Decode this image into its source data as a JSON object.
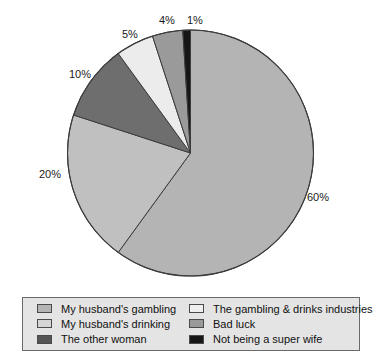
{
  "chart_data": {
    "type": "pie",
    "title": "",
    "subtitle": "",
    "xlabel": "",
    "ylabel": "",
    "grid": false,
    "legend_position": "bottom",
    "start_angle_deg": 0,
    "direction": "clockwise",
    "categories": [
      "My husband's gambling",
      "My husband's drinking",
      "The other woman",
      "The gambling & drinks industries",
      "Bad luck",
      "Not being a super wife"
    ],
    "values": [
      60,
      20,
      10,
      5,
      4,
      1
    ],
    "value_unit": "%",
    "data_labels": [
      "60%",
      "20%",
      "10%",
      "5%",
      "4%",
      "1%"
    ],
    "colors": [
      "#b4b4b4",
      "#c0c0c0",
      "#6e6e6e",
      "#ececec",
      "#9a9a9a",
      "#161616"
    ],
    "slices": [
      {
        "label": "My husband's gambling",
        "value": 60,
        "data_label": "60%",
        "color": "#b4b4b4"
      },
      {
        "label": "My husband's drinking",
        "value": 20,
        "data_label": "20%",
        "color": "#c0c0c0"
      },
      {
        "label": "The other woman",
        "value": 10,
        "data_label": "10%",
        "color": "#6e6e6e"
      },
      {
        "label": "The gambling & drinks industries",
        "value": 5,
        "data_label": "5%",
        "color": "#ececec"
      },
      {
        "label": "Bad luck",
        "value": 4,
        "data_label": "4%",
        "color": "#9a9a9a"
      },
      {
        "label": "Not being a super wife",
        "value": 1,
        "data_label": "1%",
        "color": "#161616"
      }
    ]
  },
  "labels": {
    "pct_60": "60%",
    "pct_20": "20%",
    "pct_10": "10%",
    "pct_5": "5%",
    "pct_4": "4%",
    "pct_1": "1%"
  },
  "legend": {
    "items": [
      {
        "label": "My husband's gambling",
        "color": "#b4b4b4"
      },
      {
        "label": "My husband's drinking",
        "color": "#d5d5d5"
      },
      {
        "label": "The other woman",
        "color": "#555555"
      },
      {
        "label": "The gambling & drinks industries",
        "color": "#efefef"
      },
      {
        "label": "Bad luck",
        "color": "#9a9a9a"
      },
      {
        "label": "Not being a super wife",
        "color": "#161616"
      }
    ]
  },
  "style": {
    "background": "#ffffff",
    "outline": "#3c3c3c",
    "legend_background": "#e4e4e4",
    "legend_border": "#6a6a6a",
    "text": "#111111"
  }
}
